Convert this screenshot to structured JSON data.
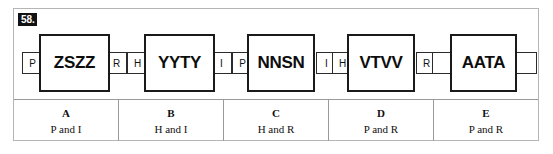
{
  "question": {
    "number": "58.",
    "stimulus_groups": [
      {
        "id": "group-1",
        "left": "P",
        "center": "ZSZZ",
        "right": "R"
      },
      {
        "id": "group-2",
        "left": "H",
        "center": "YYTY",
        "right": "I"
      },
      {
        "id": "group-3",
        "left": "P",
        "center": "NNSN",
        "right": "I"
      },
      {
        "id": "group-4",
        "left": "H",
        "center": "VTVV",
        "right": "R"
      },
      {
        "id": "group-5",
        "left": "",
        "center": "AATA",
        "right": ""
      }
    ],
    "options": [
      {
        "letter": "A",
        "text": "P and I"
      },
      {
        "letter": "B",
        "text": "H and I"
      },
      {
        "letter": "C",
        "text": "H and R"
      },
      {
        "letter": "D",
        "text": "P and R"
      },
      {
        "letter": "E",
        "text": "P and R"
      }
    ]
  }
}
